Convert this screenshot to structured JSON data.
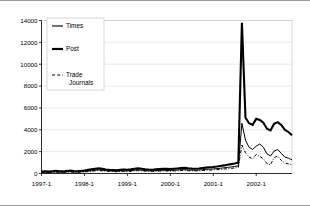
{
  "chart_data": {
    "type": "line",
    "title": "",
    "xlabel": "",
    "ylabel": "",
    "ylim": [
      0,
      14000
    ],
    "yticks": [
      0,
      2000,
      4000,
      6000,
      8000,
      10000,
      12000,
      14000
    ],
    "ytick_labels": [
      "0",
      "2000",
      "4000",
      "6000",
      "8000",
      "10000",
      "12000",
      "14000"
    ],
    "xtick_labels": [
      "1997-1",
      "1998-1",
      "1999-1",
      "2000-1",
      "2001-1",
      "2002-1"
    ],
    "xtick_positions": [
      0,
      12,
      24,
      36,
      48,
      60
    ],
    "x_range": [
      0,
      70
    ],
    "grid": "horizontal",
    "legend_position": "upper-left-inside",
    "series": [
      {
        "name": "Times",
        "style": "thin-solid",
        "values": [
          120,
          140,
          110,
          150,
          170,
          140,
          130,
          160,
          180,
          150,
          140,
          160,
          190,
          230,
          260,
          300,
          340,
          300,
          260,
          240,
          220,
          210,
          230,
          250,
          240,
          260,
          300,
          330,
          300,
          270,
          250,
          240,
          260,
          280,
          300,
          290,
          280,
          300,
          320,
          340,
          360,
          330,
          310,
          300,
          320,
          350,
          380,
          400,
          420,
          450,
          480,
          520,
          560,
          600,
          640,
          700,
          4600,
          3050,
          2400,
          2200,
          2500,
          2700,
          2400,
          1800,
          1600,
          2050,
          2200,
          1850,
          1500,
          1400,
          1250
        ]
      },
      {
        "name": "Post",
        "style": "thick-solid",
        "values": [
          180,
          200,
          170,
          210,
          240,
          210,
          190,
          230,
          260,
          220,
          210,
          240,
          280,
          330,
          380,
          430,
          470,
          420,
          370,
          340,
          320,
          300,
          330,
          360,
          350,
          380,
          430,
          470,
          430,
          390,
          360,
          350,
          380,
          410,
          430,
          420,
          400,
          430,
          460,
          490,
          520,
          480,
          450,
          430,
          460,
          500,
          540,
          570,
          600,
          640,
          690,
          740,
          800,
          860,
          920,
          1000,
          13800,
          5100,
          4600,
          4450,
          5000,
          4900,
          4650,
          4100,
          3950,
          4550,
          4700,
          4450,
          4000,
          3800,
          3500
        ]
      },
      {
        "name": "Trade Journals",
        "style": "dash-dot",
        "values": [
          90,
          100,
          80,
          110,
          130,
          110,
          100,
          120,
          140,
          115,
          110,
          125,
          150,
          180,
          210,
          240,
          270,
          240,
          205,
          190,
          175,
          165,
          180,
          200,
          190,
          205,
          235,
          260,
          235,
          215,
          200,
          190,
          205,
          220,
          235,
          225,
          215,
          235,
          250,
          265,
          280,
          260,
          245,
          235,
          250,
          275,
          295,
          315,
          330,
          355,
          380,
          410,
          440,
          470,
          505,
          550,
          2600,
          1900,
          1500,
          1350,
          1750,
          1550,
          1350,
          900,
          800,
          1450,
          1600,
          1200,
          950,
          880,
          800
        ]
      }
    ],
    "legend": [
      {
        "label": "Times",
        "style": "thin-solid"
      },
      {
        "label": "Post",
        "style": "thick-solid"
      },
      {
        "label": "Trade",
        "label2": "Journals",
        "style": "dash-dot"
      }
    ]
  }
}
